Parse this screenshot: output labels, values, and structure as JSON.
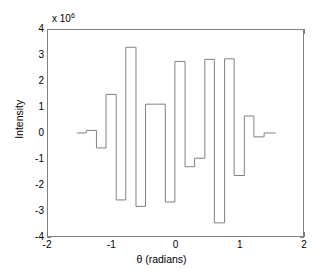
{
  "figure": {
    "background_color": "#ffffff",
    "axis_color": "#808080",
    "line_color": "#808080"
  },
  "axes": {
    "exponent_prefix": "x 10",
    "exponent_power": "6",
    "xlabel": "θ (radians)",
    "ylabel": "Intensity",
    "xticks": [
      "-2",
      "-1",
      "0",
      "1",
      "2"
    ],
    "yticks": [
      "4",
      "3",
      "2",
      "1",
      "0",
      "-1",
      "-2",
      "-3",
      "-4"
    ]
  },
  "chart_data": {
    "type": "bar",
    "title": "",
    "subtitle": "",
    "xlabel": "θ (radians)",
    "ylabel": "Intensity",
    "y_axis_multiplier": 1000000,
    "y_axis_multiplier_label": "x 10^6",
    "xlim": [
      -2,
      2
    ],
    "ylim": [
      -4,
      4
    ],
    "grid": false,
    "legend": null,
    "style": "stairstep",
    "note": "Stairstep (staircase) plot of intensity versus theta; values in units of 1e6",
    "xticks": [
      -2,
      -1,
      0,
      1,
      2
    ],
    "yticks": [
      -4,
      -3,
      -2,
      -1,
      0,
      1,
      2,
      3,
      4
    ],
    "x_edges": [
      -1.55,
      -1.4,
      -1.24,
      -1.09,
      -0.93,
      -0.78,
      -0.62,
      -0.47,
      -0.31,
      -0.16,
      -0.01,
      0.15,
      0.3,
      0.46,
      0.61,
      0.77,
      0.92,
      1.08,
      1.23,
      1.39,
      1.57
    ],
    "x_centers": [
      -1.475,
      -1.32,
      -1.165,
      -1.01,
      -0.855,
      -0.7,
      -0.545,
      -0.39,
      -0.235,
      -0.085,
      0.07,
      0.225,
      0.38,
      0.535,
      0.69,
      0.845,
      1.0,
      1.155,
      1.31,
      1.48
    ],
    "values": [
      0.0,
      0.1,
      -0.58,
      1.5,
      -2.6,
      3.33,
      -2.85,
      1.12,
      1.12,
      -2.68,
      2.78,
      -1.31,
      -0.98,
      2.86,
      -3.49,
      2.88,
      -1.65,
      0.66,
      -0.15,
      0.0
    ],
    "values_absolute": [
      0,
      100000,
      -580000,
      1500000,
      -2600000,
      3330000,
      -2850000,
      1120000,
      1120000,
      -2680000,
      2780000,
      -1310000,
      -980000,
      2860000,
      -3490000,
      2880000,
      -1650000,
      660000,
      -150000,
      0
    ]
  }
}
